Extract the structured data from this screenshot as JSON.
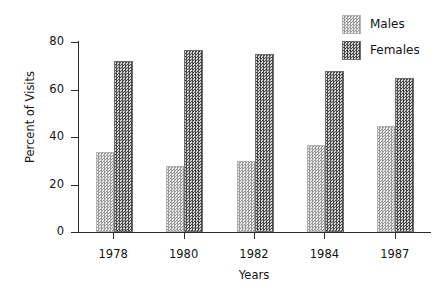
{
  "chart_data": {
    "type": "bar",
    "title": "",
    "xlabel": "Years",
    "ylabel": "Percent of Visits",
    "categories": [
      "1978",
      "1980",
      "1982",
      "1984",
      "1987"
    ],
    "series": [
      {
        "name": "Males",
        "values": [
          33,
          27,
          29,
          36,
          44
        ]
      },
      {
        "name": "Females",
        "values": [
          71,
          76,
          74,
          67,
          64
        ]
      }
    ],
    "ylim": [
      0,
      80
    ],
    "yticks": [
      0,
      20,
      40,
      60,
      80
    ],
    "ytick_labels": [
      "0",
      "20",
      "40",
      "60",
      "80"
    ],
    "grid": false,
    "legend_position": "top-right",
    "legend": [
      "Males",
      "Females"
    ],
    "colors": {
      "males": "#bdbdbd",
      "females": "#6f6f6f",
      "axis": "#2b2b2b",
      "text": "#131313",
      "background": "#ffffff"
    }
  }
}
